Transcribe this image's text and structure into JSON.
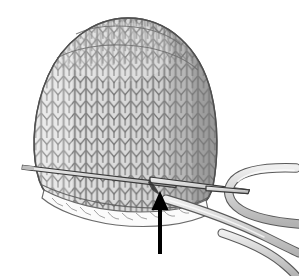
{
  "illustration": {
    "title": "Knitted hat on circular needles with working yarn",
    "subject": "knit-hat-crown-decrease-diagram",
    "background_color": "#ffffff",
    "annotation": {
      "arrow": {
        "name": "pointer-arrow",
        "color": "#000000",
        "direction": "up",
        "tip_x": 160,
        "tip_y": 191,
        "tail_y": 254,
        "head_width": 17,
        "head_height": 19,
        "shaft_width": 4,
        "label": ""
      }
    },
    "palette": {
      "knit_fill_light": "#e2e2e2",
      "knit_fill_mid": "#d2d2d2",
      "knit_fill_shadow": "#a8a8a8",
      "stitch_stroke": "#6e6e6e",
      "outline_stroke": "#555555",
      "needle_fill": "#d6d6d6",
      "needle_stroke": "#3a3a3a",
      "yarn_fill": "#d0d0d0",
      "yarn_stroke": "#5a5a5a",
      "brim_inside": "#fdfdfd",
      "arrow_black": "#000000"
    },
    "parts": [
      {
        "name": "hat-body",
        "label": "Knitted hat body",
        "fill": "#d8d8d8"
      },
      {
        "name": "hat-crown",
        "label": "Hat crown dome",
        "fill": "#dedede"
      },
      {
        "name": "hat-brim",
        "label": "Cast-on brim edge",
        "fill": "#fbfbfb"
      },
      {
        "name": "needle-back",
        "label": "Back circular needle tip",
        "fill": "#d6d6d6"
      },
      {
        "name": "needle-front",
        "label": "Front circular needle tip",
        "fill": "#d6d6d6"
      },
      {
        "name": "yarn-loop",
        "label": "Working yarn loop",
        "fill": "#d0d0d0"
      },
      {
        "name": "yarn-strand-upper",
        "label": "Upper yarn strand",
        "fill": "#d0d0d0"
      },
      {
        "name": "yarn-strand-lower",
        "label": "Lower yarn strand",
        "fill": "#d0d0d0"
      }
    ],
    "geometry": {
      "hat_left_x": 34,
      "hat_right_x": 216,
      "hat_top_y": 18,
      "hat_bottom_y": 216,
      "needle_back_start": [
        22,
        166
      ],
      "needle_back_end": [
        176,
        185
      ],
      "needle_front_start": [
        150,
        178
      ],
      "needle_front_end": [
        250,
        191
      ],
      "stitch_columns": 17,
      "stitch_rows": 15
    }
  }
}
